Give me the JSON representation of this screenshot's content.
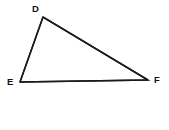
{
  "figure": {
    "kind": "geometry-diagram",
    "shape_name": "triangle",
    "background_color": "#ffffff",
    "stroke_color": "#1a1a1a",
    "stroke_width": 1.5,
    "label_color": "#121212",
    "vertices": [
      {
        "id": "D",
        "label": "D",
        "x": 43,
        "y": 17,
        "label_x": 32,
        "label_y": 4,
        "label_position": "above-left"
      },
      {
        "id": "E",
        "label": "E",
        "x": 20,
        "y": 82,
        "label_x": 7,
        "label_y": 77,
        "label_position": "left"
      },
      {
        "id": "F",
        "label": "F",
        "x": 148,
        "y": 80,
        "label_x": 154,
        "label_y": 75,
        "label_position": "right"
      }
    ],
    "edges": [
      {
        "id": "DE",
        "from": "D",
        "to": "E"
      },
      {
        "id": "EF",
        "from": "E",
        "to": "F"
      },
      {
        "id": "FD",
        "from": "F",
        "to": "D"
      }
    ],
    "polygon_points": "43,17 20,82 148,80"
  }
}
